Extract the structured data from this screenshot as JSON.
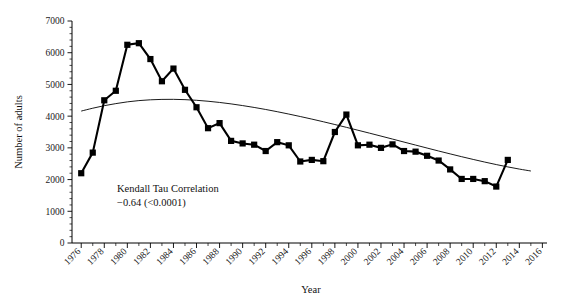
{
  "chart_data": {
    "type": "line",
    "title": "",
    "xlabel": "Year",
    "ylabel": "Number of adults",
    "xlim": [
      1975.2,
      2016.4
    ],
    "ylim": [
      0,
      7000
    ],
    "grid": false,
    "legend": null,
    "x": [
      1976,
      1977,
      1978,
      1979,
      1980,
      1981,
      1982,
      1983,
      1984,
      1985,
      1986,
      1987,
      1988,
      1989,
      1990,
      1991,
      1992,
      1993,
      1994,
      1995,
      1996,
      1997,
      1998,
      1999,
      2000,
      2001,
      2002,
      2003,
      2004,
      2005,
      2006,
      2007,
      2008,
      2009,
      2010,
      2011,
      2012,
      2013,
      2014,
      2015
    ],
    "series": [
      {
        "name": "Number of adults",
        "marker": "filled-square",
        "color": "#000000",
        "values": [
          2200,
          2850,
          4500,
          4800,
          6250,
          6300,
          5800,
          5100,
          5500,
          4830,
          4280,
          3620,
          3780,
          3220,
          3140,
          3100,
          2900,
          3180,
          3080,
          2570,
          2620,
          2580,
          3500,
          4050,
          3080,
          3100,
          3000,
          3110,
          2900,
          2880,
          2750,
          2600,
          2320,
          2020,
          2020,
          1950,
          1780,
          2620,
          null,
          null
        ]
      },
      {
        "name": "trend curve",
        "marker": "none",
        "color": "#000000",
        "values": [
          4160,
          4250,
          4330,
          4395,
          4450,
          4490,
          4515,
          4528,
          4530,
          4520,
          4500,
          4470,
          4432,
          4386,
          4333,
          4274,
          4210,
          4140,
          4066,
          3988,
          3907,
          3823,
          3736,
          3647,
          3556,
          3464,
          3371,
          3277,
          3182,
          3088,
          2994,
          2901,
          2810,
          2721,
          2635,
          2552,
          2473,
          2399,
          2331,
          2270
        ]
      }
    ],
    "x_major_ticks": [
      1976,
      1978,
      1980,
      1982,
      1984,
      1986,
      1988,
      1990,
      1992,
      1994,
      1996,
      1998,
      2000,
      2002,
      2004,
      2006,
      2008,
      2010,
      2012,
      2014,
      2016
    ],
    "x_tick_labels": [
      "1976",
      "1978",
      "1980",
      "1982",
      "1984",
      "1986",
      "1988",
      "1990",
      "1992",
      "1994",
      "1996",
      "1998",
      "2000",
      "2002",
      "2004",
      "2006",
      "2008",
      "2010",
      "2012",
      "2014",
      "2016"
    ],
    "y_major_ticks": [
      0,
      1000,
      2000,
      3000,
      4000,
      5000,
      6000,
      7000
    ],
    "y_tick_labels": [
      "0",
      "1000",
      "2000",
      "3000",
      "4000",
      "5000",
      "6000",
      "7000"
    ],
    "y_minor_interval": 200,
    "x_minor_interval": 1,
    "annotations": [
      {
        "name": "kendall-tau-annotation",
        "line1": "Kendall Tau Correlation",
        "line2": "−0.64 (<0.0001)",
        "x": 1982.0,
        "y": 1850
      }
    ]
  }
}
